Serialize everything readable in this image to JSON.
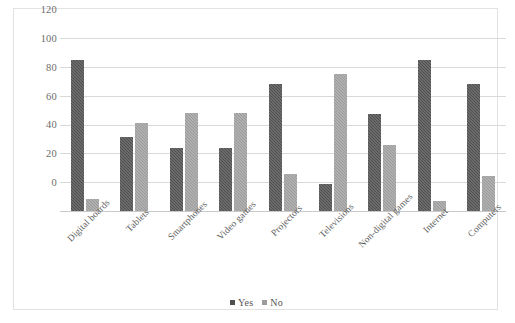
{
  "chart_data": {
    "type": "bar",
    "title": "",
    "subtitle": "",
    "xlabel": "",
    "ylabel": "",
    "ylim": [
      0,
      120
    ],
    "yticks": [
      0,
      20,
      40,
      60,
      80,
      100,
      120
    ],
    "grid": true,
    "legend_position": "bottom",
    "categories": [
      "Digital boards",
      "Tablets",
      "Smartphones",
      "Video games",
      "Projectors",
      "Televisions",
      "Non-digital games",
      "Internet",
      "Computers"
    ],
    "series": [
      {
        "name": "Yes",
        "color": "#4f4f4f",
        "values": [
          105,
          51,
          44,
          44,
          88,
          19,
          67,
          105,
          88
        ]
      },
      {
        "name": "No",
        "color": "#9b9b9b",
        "values": [
          8,
          61,
          68,
          68,
          26,
          95,
          46,
          7,
          24
        ]
      }
    ]
  },
  "legend": {
    "items": [
      {
        "label": "Yes",
        "swatch": "yes"
      },
      {
        "label": "No",
        "swatch": "no"
      }
    ]
  }
}
